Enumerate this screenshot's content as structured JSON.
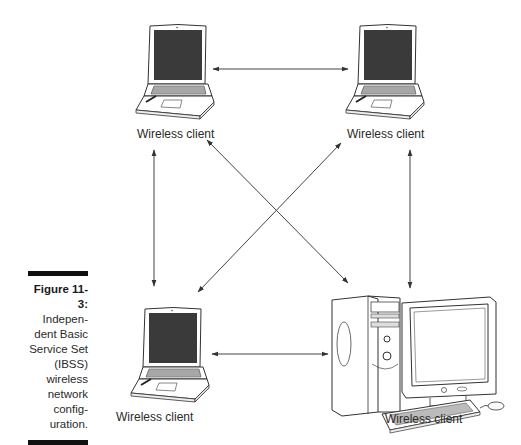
{
  "figure": {
    "number": "Figure 11-3:",
    "caption_lines": [
      "Indepen-",
      "dent Basic",
      "Service Set",
      "(IBSS)",
      "wireless",
      "network",
      "config-",
      "uration."
    ]
  },
  "nodes": [
    {
      "id": "laptop-top-left",
      "type": "laptop",
      "label": "Wireless client"
    },
    {
      "id": "laptop-top-right",
      "type": "laptop",
      "label": "Wireless client"
    },
    {
      "id": "laptop-bottom-left",
      "type": "laptop",
      "label": "Wireless client"
    },
    {
      "id": "desktop-bottom-right",
      "type": "desktop-computer",
      "label": "Wireless client"
    }
  ],
  "connections": [
    {
      "from": "laptop-top-left",
      "to": "laptop-top-right",
      "type": "bidirectional"
    },
    {
      "from": "laptop-top-left",
      "to": "laptop-bottom-left",
      "type": "bidirectional"
    },
    {
      "from": "laptop-top-left",
      "to": "desktop-bottom-right",
      "type": "bidirectional"
    },
    {
      "from": "laptop-top-right",
      "to": "laptop-bottom-left",
      "type": "bidirectional"
    },
    {
      "from": "laptop-top-right",
      "to": "desktop-bottom-right",
      "type": "bidirectional"
    },
    {
      "from": "laptop-bottom-left",
      "to": "desktop-bottom-right",
      "type": "bidirectional"
    }
  ]
}
